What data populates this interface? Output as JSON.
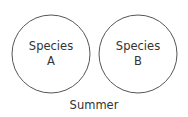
{
  "diagram": {
    "circles": [
      {
        "id": "A",
        "line1": "Species",
        "line2": "A",
        "cx": 51,
        "cy": 54,
        "r": 39
      },
      {
        "id": "B",
        "line1": "Species",
        "line2": "B",
        "cx": 138,
        "cy": 54,
        "r": 39
      }
    ],
    "caption": "Summer",
    "stroke_color": "#555555"
  }
}
